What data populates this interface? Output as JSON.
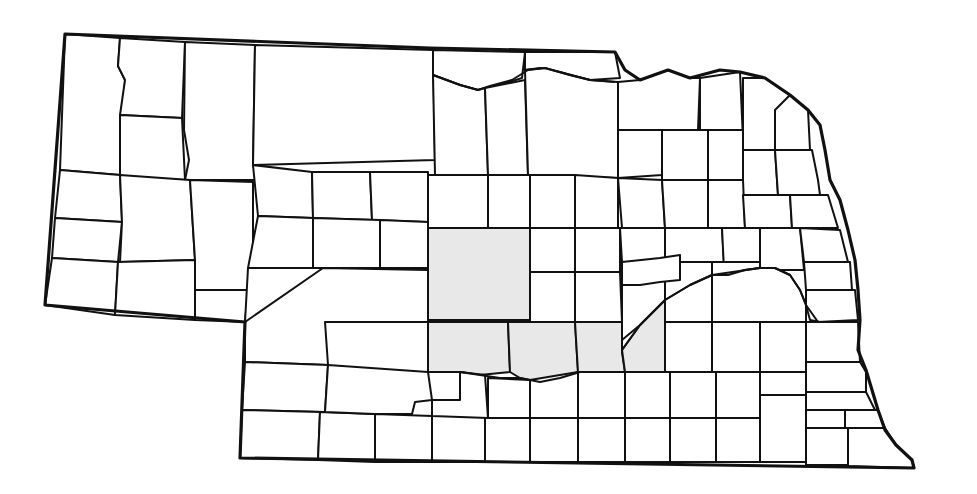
{
  "map": {
    "title": "Nebraska counties",
    "colors": {
      "background": "#ffffff",
      "outline": "#111111",
      "highlight": "#e8e8e8"
    },
    "highlighted_region": "central Nebraska (Custer, Dawson, Gosper, Phelps, Buffalo counties)",
    "state_outline": "65,34 430,48 615,52 625,70 640,80 668,70 690,78 720,70 740,72 765,78 790,95 808,110 820,125 825,150 830,180 840,200 848,230 855,260 858,290 860,320 858,350 866,370 872,390 878,410 885,430 896,445 912,460 914,468 240,458 245,322 45,305 65,34",
    "rivers": [
      "433,75 460,85 478,90 490,86 512,80 528,70 545,68 570,75 590,80 615,82",
      "622,350 640,325 665,300 690,285 712,275 728,275 745,270 760,268 775,268 790,275 800,290 806,305 810,320 820,322",
      "428,372 460,372 480,375 500,378 520,378 540,382 560,378 580,372 625,372"
    ],
    "counties": [
      {
        "id": "sioux",
        "points": "65,34 120,38 118,66 125,80 120,175 60,170",
        "shaded": false
      },
      {
        "id": "dawes",
        "points": "120,38 185,42 182,118 120,115 125,80 118,66",
        "shaded": false
      },
      {
        "id": "box-butte",
        "points": "120,115 182,118 185,180 120,178",
        "shaded": false
      },
      {
        "id": "sheridan",
        "points": "185,42 255,45 253,165 258,180 185,180 189,160 184,130",
        "shaded": false
      },
      {
        "id": "cherry",
        "points": "255,45 433,50 435,160 253,165",
        "shaded": false
      },
      {
        "id": "keya-paha",
        "points": "433,50 525,52 522,78 500,85 478,90 460,85 433,75",
        "shaded": false
      },
      {
        "id": "brown",
        "points": "433,75 460,85 478,90 485,88 488,175 435,175",
        "shaded": false
      },
      {
        "id": "rock",
        "points": "485,88 525,80 528,175 488,175",
        "shaded": false
      },
      {
        "id": "boyd",
        "points": "525,52 615,52 620,78 590,80 560,72 540,68 525,70",
        "shaded": false
      },
      {
        "id": "holt",
        "points": "525,70 545,68 570,75 590,80 618,82 618,178 528,175",
        "shaded": false
      },
      {
        "id": "knox",
        "points": "618,82 640,80 668,70 690,78 700,78 698,130 618,130",
        "shaded": false
      },
      {
        "id": "cedar",
        "points": "700,78 740,72 743,140 700,140",
        "shaded": false
      },
      {
        "id": "dixon",
        "points": "743,78 765,78 790,95 780,110 775,150 743,150",
        "shaded": false
      },
      {
        "id": "dakota",
        "points": "775,110 790,95 808,110 810,150 775,150",
        "shaded": false
      },
      {
        "id": "scotts-bluff",
        "points": "60,170 120,175 122,222 55,218",
        "shaded": false
      },
      {
        "id": "banner",
        "points": "55,218 122,222 118,262 52,258",
        "shaded": false
      },
      {
        "id": "kimball",
        "points": "52,258 118,262 115,315 45,305",
        "shaded": false
      },
      {
        "id": "morrill",
        "points": "120,175 190,180 195,260 120,262 122,222",
        "shaded": false
      },
      {
        "id": "cheyenne",
        "points": "118,262 195,260 195,320 115,315",
        "shaded": false
      },
      {
        "id": "garden",
        "points": "190,180 253,182 253,290 195,290 195,260",
        "shaded": false
      },
      {
        "id": "deuel",
        "points": "195,290 248,290 245,322 195,320",
        "shaded": false
      },
      {
        "id": "sheridan-s",
        "points": "253,165 312,172 313,218 258,216",
        "shaded": false
      },
      {
        "id": "grant",
        "points": "312,172 370,172 372,220 313,218",
        "shaded": false
      },
      {
        "id": "hooker",
        "points": "370,172 428,172 428,222 372,220",
        "shaded": false
      },
      {
        "id": "thomas",
        "points": "428,175 488,175 488,228 428,228",
        "shaded": false
      },
      {
        "id": "blaine",
        "points": "488,175 530,175 530,228 488,228",
        "shaded": false
      },
      {
        "id": "loup",
        "points": "530,175 575,175 575,228 530,228",
        "shaded": false
      },
      {
        "id": "garfield",
        "points": "575,175 618,178 618,228 575,228",
        "shaded": false
      },
      {
        "id": "arthur",
        "points": "258,216 313,218 313,268 248,268",
        "shaded": false
      },
      {
        "id": "mcpherson",
        "points": "313,218 380,220 380,268 313,268",
        "shaded": false
      },
      {
        "id": "logan",
        "points": "380,220 428,222 428,268 380,268",
        "shaded": false
      },
      {
        "id": "keith",
        "points": "248,268 323,268 325,322 245,322",
        "shaded": false
      },
      {
        "id": "lincoln",
        "points": "323,268 428,270 428,322 325,322 328,365 245,362 245,322",
        "shaded": false
      },
      {
        "id": "custer",
        "points": "428,228 530,228 530,320 428,320",
        "shaded": true
      },
      {
        "id": "valley",
        "points": "530,228 575,228 575,272 530,272",
        "shaded": false
      },
      {
        "id": "greeley",
        "points": "575,228 620,228 620,272 575,272",
        "shaded": false
      },
      {
        "id": "sherman",
        "points": "530,272 575,272 575,322 530,322",
        "shaded": false
      },
      {
        "id": "howard",
        "points": "575,272 620,272 622,322 575,322",
        "shaded": false
      },
      {
        "id": "dawson",
        "points": "428,322 508,322 510,372 480,375 460,372 428,372",
        "shaded": true
      },
      {
        "id": "buffalo",
        "points": "508,322 575,322 578,372 560,378 540,382 520,378 510,372",
        "shaded": true
      },
      {
        "id": "hall-w",
        "points": "575,322 622,322 622,352 625,372 580,372 578,372",
        "shaded": true
      },
      {
        "id": "hall",
        "points": "622,290 665,290 665,372 625,372 622,350 640,325 665,300",
        "shaded": true
      },
      {
        "id": "wheeler",
        "points": "618,130 662,130 662,175 618,178",
        "shaded": false
      },
      {
        "id": "antelope",
        "points": "662,130 708,130 708,180 662,180",
        "shaded": false
      },
      {
        "id": "pierce",
        "points": "708,130 743,130 743,180 708,180",
        "shaded": false
      },
      {
        "id": "wayne",
        "points": "743,150 775,150 778,195 743,195",
        "shaded": false
      },
      {
        "id": "thurston",
        "points": "775,150 812,150 818,180 820,195 778,195",
        "shaded": false
      },
      {
        "id": "boone",
        "points": "618,178 662,180 665,228 622,228",
        "shaded": false
      },
      {
        "id": "madison",
        "points": "662,180 708,180 708,228 665,228",
        "shaded": false
      },
      {
        "id": "stanton",
        "points": "708,180 743,180 745,228 708,228",
        "shaded": false
      },
      {
        "id": "cuming",
        "points": "743,195 790,195 792,228 745,228",
        "shaded": false
      },
      {
        "id": "burt",
        "points": "790,195 828,195 838,228 792,228",
        "shaded": false
      },
      {
        "id": "nance",
        "points": "620,228 665,228 665,262 622,262",
        "shaded": false
      },
      {
        "id": "platte",
        "points": "665,228 722,228 724,262 665,262",
        "shaded": false
      },
      {
        "id": "colfax",
        "points": "722,228 760,228 760,270 724,270",
        "shaded": false
      },
      {
        "id": "dodge",
        "points": "760,228 800,228 804,270 760,270",
        "shaded": false
      },
      {
        "id": "washington",
        "points": "800,228 840,230 848,262 804,262",
        "shaded": false
      },
      {
        "id": "merrick",
        "points": "622,262 665,262 665,300 640,325 622,340",
        "shaded": false
      },
      {
        "id": "polk",
        "points": "665,262 712,262 712,275 690,285 665,300",
        "shaded": false
      },
      {
        "id": "butler",
        "points": "712,262 760,262 760,268 745,270 728,275 712,275",
        "shaded": false
      },
      {
        "id": "saunders",
        "points": "712,275 760,268 775,268 790,275 800,290 806,305 806,322 712,322",
        "shaded": false
      },
      {
        "id": "douglas",
        "points": "804,262 850,262 852,290 806,290",
        "shaded": false
      },
      {
        "id": "sarpy",
        "points": "806,290 855,290 858,320 818,322 806,305",
        "shaded": false
      },
      {
        "id": "hamilton",
        "points": "665,322 712,322 712,372 665,372",
        "shaded": false
      },
      {
        "id": "york",
        "points": "712,322 760,322 760,372 712,372",
        "shaded": false
      },
      {
        "id": "seward",
        "points": "760,322 806,322 806,372 760,372",
        "shaded": false
      },
      {
        "id": "lancaster",
        "points": "806,322 858,322 860,362 806,362",
        "shaded": false
      },
      {
        "id": "cass",
        "points": "806,362 860,362 866,372 866,392 806,392",
        "shaded": false
      },
      {
        "id": "otoe",
        "points": "806,392 866,392 875,410 806,410",
        "shaded": false
      },
      {
        "id": "perkins",
        "points": "245,362 328,365 325,412 242,410",
        "shaded": false
      },
      {
        "id": "chase",
        "points": "242,410 320,412 318,460 240,458",
        "shaded": false
      },
      {
        "id": "hayes",
        "points": "320,412 375,414 375,462 318,460",
        "shaded": false
      },
      {
        "id": "frontier",
        "points": "328,365 428,372 432,400 415,402 412,414 375,414 325,412",
        "shaded": false
      },
      {
        "id": "hitchcock",
        "points": "375,414 432,416 432,462 375,462",
        "shaded": false
      },
      {
        "id": "red-willow",
        "points": "432,400 485,404 485,462 432,462",
        "shaded": false
      },
      {
        "id": "gosper",
        "points": "460,372 485,375 488,418 432,416 432,400 460,400",
        "shaded": false
      },
      {
        "id": "furnas",
        "points": "485,418 530,418 530,462 485,462",
        "shaded": false
      },
      {
        "id": "harlan",
        "points": "530,418 578,418 578,462 530,462",
        "shaded": false
      },
      {
        "id": "phelps",
        "points": "488,378 530,380 530,418 488,418",
        "shaded": false
      },
      {
        "id": "kearney",
        "points": "530,380 578,372 578,418 530,418",
        "shaded": false
      },
      {
        "id": "franklin",
        "points": "578,418 625,418 625,462 578,462",
        "shaded": false
      },
      {
        "id": "adams",
        "points": "578,372 625,372 625,418 578,418",
        "shaded": false
      },
      {
        "id": "webster",
        "points": "625,418 670,418 670,462 625,462",
        "shaded": false
      },
      {
        "id": "clay",
        "points": "625,372 670,372 670,418 625,418",
        "shaded": false
      },
      {
        "id": "nuckolls",
        "points": "670,418 716,418 716,462 670,462",
        "shaded": false
      },
      {
        "id": "fillmore",
        "points": "670,372 716,372 716,418 670,418",
        "shaded": false
      },
      {
        "id": "thayer",
        "points": "716,418 760,418 760,462 716,462",
        "shaded": false
      },
      {
        "id": "saline",
        "points": "716,372 760,372 760,418 716,418",
        "shaded": false
      },
      {
        "id": "jefferson",
        "points": "760,395 806,395 806,462 760,462",
        "shaded": false
      },
      {
        "id": "gage",
        "points": "760,372 806,372 806,395 760,395",
        "shaded": false
      },
      {
        "id": "johnson",
        "points": "806,410 845,410 845,428 806,428",
        "shaded": false
      },
      {
        "id": "nemaha",
        "points": "845,410 878,410 885,428 845,428",
        "shaded": false
      },
      {
        "id": "pawnee",
        "points": "806,428 848,428 848,465 806,465",
        "shaded": false
      },
      {
        "id": "richardson",
        "points": "848,428 885,428 896,445 912,460 914,468 848,466",
        "shaded": false
      },
      {
        "id": "garfield-inner",
        "points": "622,262 660,258 680,255 680,280 660,282 640,285 622,285",
        "shaded": false
      }
    ]
  }
}
